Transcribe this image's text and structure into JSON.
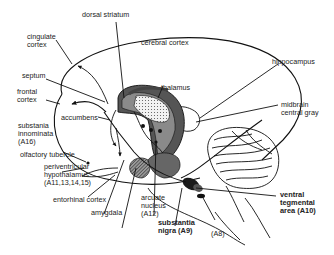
{
  "diagram": {
    "colors": {
      "outline": "#111111",
      "striatum_dark": "#555555",
      "striatum_mid": "#8a8a8a",
      "thalamus_dotted": "#e8e8e8",
      "substantia_nigra": "#1a1a1a",
      "background": "#ffffff"
    },
    "labels": {
      "dorsal_striatum": "dorsal striatum",
      "cingulate_cortex_1": "cingulate",
      "cingulate_cortex_2": "cortex",
      "cerebral_cortex": "cerebral cortex",
      "hippocampus": "hippocampus",
      "septum": "septum",
      "thalamus": "thalamus",
      "frontal_cortex_1": "frontal",
      "frontal_cortex_2": "cortex",
      "accumbens": "accumbens",
      "midbrain_central_gray_1": "midbrain",
      "midbrain_central_gray_2": "central gray",
      "substantia_innominata_1": "substania",
      "substantia_innominata_2": "innominata",
      "substantia_innominata_3": "(A16)",
      "olfactory_tubercle": "olfactory tubercle",
      "periventricular_1": "periventricular",
      "periventricular_2": "hypothalamus",
      "periventricular_3": "(A11,13,14,15)",
      "entorhinal_cortex": "entorhinal cortex",
      "amygdala": "amygdala",
      "arcuate_1": "arcuate",
      "arcuate_2": "nucleus",
      "arcuate_3": "(A12)",
      "substantia_nigra_1": "substantia",
      "substantia_nigra_2": "nigra (A9)",
      "a8": "(A8)",
      "vta_1": "ventral",
      "vta_2": "tegmental",
      "vta_3": "area (A10)"
    }
  }
}
